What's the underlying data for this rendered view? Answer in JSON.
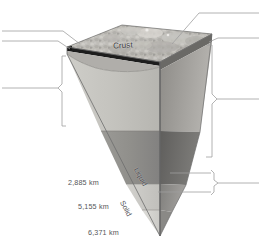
{
  "figure": {
    "palette": {
      "surface_rock_light": "#cfcdc8",
      "surface_rock_mid": "#b4b2ad",
      "surface_rock_dark": "#8e8c88",
      "crust_band": "#1d1d1d",
      "upper_mantle_front": "#c3c2bd",
      "lower_mantle_front": "#8f8e8a",
      "outer_core_front": "#cbcac6",
      "inner_core_front": "#d8d7d3",
      "side_wall_upper": "#a7a5a1",
      "side_wall_lower": "#6f6e6b",
      "side_wall_core": "#949290",
      "leader_line": "#9a9a9a",
      "outline": "#6d6d6d",
      "text": "#555558",
      "background": "#ffffff"
    }
  },
  "crust": {
    "label": "Crust"
  },
  "core_state_labels": [
    {
      "id": "liquid",
      "text": "Liquid"
    },
    {
      "id": "solid",
      "text": "Solid"
    }
  ],
  "depth_scale": {
    "unit": "km",
    "marks": [
      {
        "id": "core-mantle-boundary",
        "text": "2,885 km",
        "value": 2885
      },
      {
        "id": "inner-core-boundary",
        "text": "5,155 km",
        "value": 5155
      },
      {
        "id": "earth-center",
        "text": "6,371 km",
        "value": 6371
      }
    ]
  },
  "callouts": {
    "left": [
      {
        "id": "left-leader-top",
        "text": ""
      },
      {
        "id": "left-leader-second",
        "text": ""
      },
      {
        "id": "left-brace-mantle",
        "text": ""
      }
    ],
    "right": [
      {
        "id": "right-leader-top",
        "text": ""
      },
      {
        "id": "right-leader-second",
        "text": ""
      },
      {
        "id": "right-brace-mantle",
        "text": ""
      },
      {
        "id": "right-brace-core",
        "text": ""
      }
    ]
  }
}
